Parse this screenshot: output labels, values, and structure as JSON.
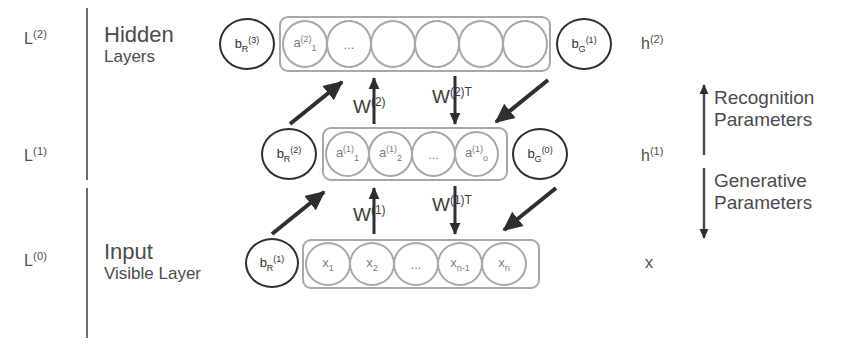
{
  "figure": {
    "colors": {
      "ink": "#4b4b4d",
      "node_stroke": "#a8a8a8",
      "bias_stroke": "#2f2f31",
      "arrow": "#2f2f31",
      "divider": "#6e6e70",
      "background": "#ffffff"
    }
  },
  "left_labels": [
    {
      "name": "level-2",
      "text": "L",
      "sup": "(2)"
    },
    {
      "name": "level-1",
      "text": "L",
      "sup": "(1)"
    },
    {
      "name": "level-0",
      "text": "L",
      "sup": "(0)"
    }
  ],
  "sections": [
    {
      "name": "hidden-section",
      "title": "Hidden",
      "subtitle": "Layers"
    },
    {
      "name": "input-section",
      "title": "Input",
      "subtitle": "Visible Layer"
    }
  ],
  "layers": [
    {
      "name": "hidden-layer-2",
      "left_bias": {
        "base": "b",
        "sub": "R",
        "sup": "(3)"
      },
      "right_bias": {
        "base": "b",
        "sub": "G",
        "sup": "(1)"
      },
      "nodes": [
        {
          "base": "a",
          "sup": "(2)",
          "sub": "1"
        },
        {
          "base": "...",
          "sup": "",
          "sub": ""
        },
        {
          "base": "",
          "sup": "",
          "sub": ""
        },
        {
          "base": "",
          "sup": "",
          "sub": ""
        },
        {
          "base": "",
          "sup": "",
          "sub": ""
        },
        {
          "base": "",
          "sup": "",
          "sub": ""
        }
      ]
    },
    {
      "name": "hidden-layer-1",
      "left_bias": {
        "base": "b",
        "sub": "R",
        "sup": "(2)"
      },
      "right_bias": {
        "base": "b",
        "sub": "G",
        "sup": "(0)"
      },
      "nodes": [
        {
          "base": "a",
          "sup": "(1)",
          "sub": "1"
        },
        {
          "base": "a",
          "sup": "(1)",
          "sub": "2"
        },
        {
          "base": "...",
          "sup": "",
          "sub": ""
        },
        {
          "base": "a",
          "sup": "(1)",
          "sub": "o"
        }
      ]
    },
    {
      "name": "visible-layer-0",
      "left_bias": {
        "base": "b",
        "sub": "R",
        "sup": "(1)"
      },
      "right_bias": null,
      "nodes": [
        {
          "base": "x",
          "sup": "",
          "sub": "1"
        },
        {
          "base": "x",
          "sup": "",
          "sub": "2"
        },
        {
          "base": "...",
          "sup": "",
          "sub": ""
        },
        {
          "base": "x",
          "sup": "",
          "sub": "n-1"
        },
        {
          "base": "x",
          "sup": "",
          "sub": "n"
        }
      ]
    }
  ],
  "weights": [
    {
      "name": "weight-w2",
      "base": "W",
      "sup": "(2)"
    },
    {
      "name": "weight-w2-transpose",
      "base": "W",
      "sup": "(2)T"
    },
    {
      "name": "weight-w1",
      "base": "W",
      "sup": "(1)"
    },
    {
      "name": "weight-w1-transpose",
      "base": "W",
      "sup": "(1)T"
    }
  ],
  "right_labels": [
    {
      "name": "activation-h2",
      "text": "h",
      "sup": "(2)"
    },
    {
      "name": "activation-h1",
      "text": "h",
      "sup": "(1)"
    },
    {
      "name": "input-x",
      "text": "x",
      "sup": ""
    }
  ],
  "parameter_groups": [
    {
      "name": "recognition-parameters",
      "line1": "Recognition",
      "line2": "Parameters",
      "direction": "up"
    },
    {
      "name": "generative-parameters",
      "line1": "Generative",
      "line2": "Parameters",
      "direction": "down"
    }
  ]
}
